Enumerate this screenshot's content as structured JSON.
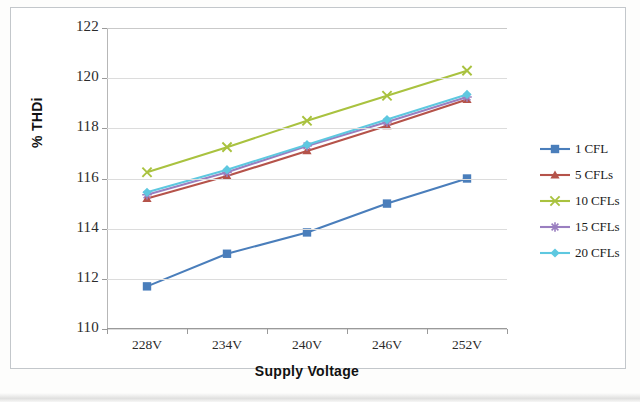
{
  "chart_data": {
    "type": "line",
    "title": "",
    "xlabel": "Supply Voltage",
    "ylabel": "% THDi",
    "categories": [
      "228V",
      "234V",
      "240V",
      "246V",
      "252V"
    ],
    "ylim": [
      110,
      122
    ],
    "yticks": [
      110,
      112,
      114,
      116,
      118,
      120,
      122
    ],
    "ytick_labels": [
      "110",
      "112",
      "114",
      "116",
      "118",
      "120",
      "122"
    ],
    "grid": true,
    "legend_position": "right",
    "series": [
      {
        "name": "1 CFL",
        "color": "#4a7ebb",
        "marker": "square",
        "values": [
          111.7,
          113.0,
          113.85,
          115.0,
          116.0
        ]
      },
      {
        "name": "5 CFLs",
        "color": "#b5534a",
        "marker": "triangle",
        "values": [
          115.2,
          116.1,
          117.1,
          118.1,
          119.15
        ]
      },
      {
        "name": "10 CFLs",
        "color": "#a9c23f",
        "marker": "cross",
        "values": [
          116.25,
          117.25,
          118.3,
          119.3,
          120.3
        ]
      },
      {
        "name": "15 CFLs",
        "color": "#9a7fc0",
        "marker": "star",
        "values": [
          115.35,
          116.25,
          117.3,
          118.25,
          119.25
        ]
      },
      {
        "name": "20 CFLs",
        "color": "#5ec8e0",
        "marker": "diamond",
        "values": [
          115.45,
          116.35,
          117.35,
          118.35,
          119.35
        ]
      }
    ]
  },
  "axes": {
    "x_title": "Supply Voltage",
    "y_title": "% THDi"
  },
  "legend": {
    "items": [
      {
        "label": "1 CFL"
      },
      {
        "label": "5 CFLs"
      },
      {
        "label": "10 CFLs"
      },
      {
        "label": "15 CFLs"
      },
      {
        "label": "20 CFLs"
      }
    ]
  }
}
